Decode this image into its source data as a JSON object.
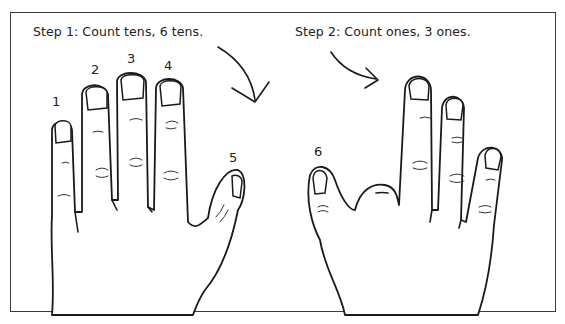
{
  "figure": {
    "step1_caption": "Step 1: Count tens, 6 tens.",
    "step2_caption": "Step 2: Count ones, 3 ones.",
    "left_hand": {
      "description": "open hand with five fingers raised",
      "finger_labels": [
        "1",
        "2",
        "3",
        "4",
        "5"
      ]
    },
    "right_hand": {
      "description": "hand with thumb and three fingers raised",
      "finger_labels": [
        "6"
      ]
    },
    "arrows": [
      "arrow-step1-to-step2",
      "arrow-step2-to-hand"
    ]
  }
}
